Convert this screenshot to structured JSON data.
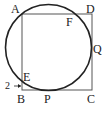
{
  "diagram": {
    "labels": {
      "A": "A",
      "B": "B",
      "C": "C",
      "D": "D",
      "E": "E",
      "F": "F",
      "P": "P",
      "Q": "Q"
    },
    "annotation": "2",
    "colors": {
      "stroke": "#222222",
      "square": "#555555"
    }
  }
}
